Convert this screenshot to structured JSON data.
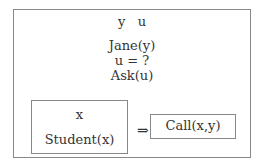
{
  "drs": {
    "referents": "y   u",
    "conditions": [
      "Jane(y)",
      "u = ?",
      "Ask(u)"
    ],
    "implication": {
      "antecedent": {
        "referents": "x",
        "conditions": [
          "Student(x)"
        ]
      },
      "arrow": "⇒",
      "consequent": {
        "referents": "",
        "conditions": [
          "Call(x,y)"
        ]
      }
    }
  }
}
